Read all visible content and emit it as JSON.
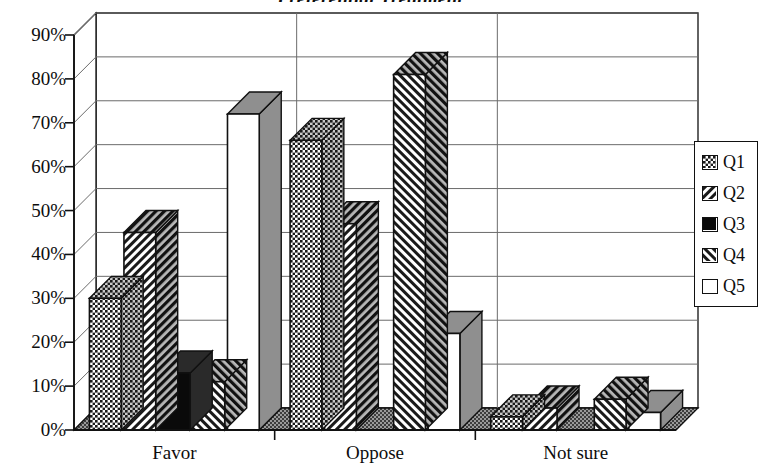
{
  "chart_data": {
    "type": "bar",
    "title": "Preferential Treatment",
    "xlabel": "",
    "ylabel": "",
    "categories": [
      "Favor",
      "Oppose",
      "Not sure"
    ],
    "series": [
      {
        "name": "Q1",
        "pattern": "checker-dots",
        "values": [
          30,
          66,
          3
        ]
      },
      {
        "name": "Q2",
        "pattern": "diagonal-up",
        "values": [
          45,
          47,
          5
        ]
      },
      {
        "name": "Q3",
        "pattern": "solid-black",
        "values": [
          13,
          0,
          0
        ]
      },
      {
        "name": "Q4",
        "pattern": "diagonal-down",
        "values": [
          11,
          81,
          7
        ]
      },
      {
        "name": "Q5",
        "pattern": "white-empty",
        "values": [
          72,
          22,
          4
        ]
      }
    ],
    "ylim": [
      0,
      90
    ],
    "ytick_labels": [
      "0%",
      "10%",
      "20%",
      "30%",
      "40%",
      "50%",
      "60%",
      "70%",
      "80%",
      "90%"
    ],
    "ytick_values": [
      0,
      10,
      20,
      30,
      40,
      50,
      60,
      70,
      80,
      90
    ],
    "grid": true,
    "legend_position": "right",
    "three_d": true
  },
  "legend": {
    "entries": [
      {
        "label": "Q1"
      },
      {
        "label": "Q2"
      },
      {
        "label": "Q3"
      },
      {
        "label": "Q4"
      },
      {
        "label": "Q5"
      }
    ]
  },
  "colors": {
    "ink": "#111111",
    "plot_background": "#ffffff",
    "gridline": "#6b6b6b",
    "side_face": "#8c8c8c",
    "floor": "#7a7a7a"
  }
}
